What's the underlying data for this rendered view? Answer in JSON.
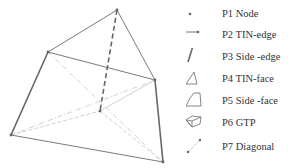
{
  "figure": {
    "vertices": {
      "top": [
        117,
        10
      ],
      "upper_left": [
        48,
        52
      ],
      "left": [
        11,
        135
      ],
      "right": [
        155,
        80
      ],
      "bottom_right": [
        163,
        162
      ],
      "center": [
        100,
        111
      ]
    },
    "colors": {
      "edge": "#777777",
      "hidden": "#bbbbbb",
      "side_edge": "#666666"
    }
  },
  "legend": {
    "items": [
      {
        "label": "P1 Node",
        "icon": "node-icon"
      },
      {
        "label": "P2 TIN-edge",
        "icon": "tin-edge-icon"
      },
      {
        "label": "P3 Side -edge",
        "icon": "side-edge-icon"
      },
      {
        "label": "P4 TIN-face",
        "icon": "tin-face-icon"
      },
      {
        "label": "P5 Side -face",
        "icon": "side-face-icon"
      },
      {
        "label": "P6 GTP",
        "icon": "gtp-icon"
      },
      {
        "label": "P7 Diagonal",
        "icon": "diagonal-icon"
      }
    ]
  }
}
